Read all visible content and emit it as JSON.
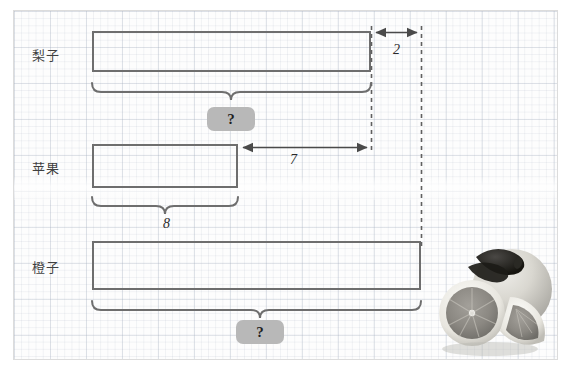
{
  "diagram": {
    "rows": [
      {
        "id": "pear",
        "label": "梨子",
        "label_x": 32,
        "label_y": 45,
        "bar": {
          "x": 92,
          "y": 31,
          "w": 279,
          "h": 41
        }
      },
      {
        "id": "apple",
        "label": "苹果",
        "label_x": 32,
        "label_y": 158,
        "bar": {
          "x": 92,
          "y": 144,
          "w": 146,
          "h": 44
        }
      },
      {
        "id": "orange",
        "label": "橙子",
        "label_x": 32,
        "label_y": 257,
        "bar": {
          "x": 92,
          "y": 241,
          "w": 329,
          "h": 49
        }
      }
    ],
    "braces": [
      {
        "id": "pear-brace",
        "x1": 92,
        "x2": 371,
        "y": 82,
        "tip_y": 96,
        "value": "?"
      },
      {
        "id": "apple-brace",
        "x1": 92,
        "x2": 238,
        "y": 196,
        "tip_y": 210,
        "value": "8"
      },
      {
        "id": "orange-brace",
        "x1": 92,
        "x2": 421,
        "y": 300,
        "tip_y": 314,
        "value": "?"
      }
    ],
    "badges": [
      {
        "id": "pear-unknown",
        "value": "?",
        "x": 207,
        "y": 107,
        "w": 48,
        "h": 24
      },
      {
        "id": "orange-unknown",
        "value": "?",
        "x": 236,
        "y": 320,
        "w": 48,
        "h": 24
      }
    ],
    "numbers": [
      {
        "id": "gap-pear-to-total",
        "value": "8",
        "x": 163,
        "y": 216
      },
      {
        "id": "gap-apple-to-pear",
        "value": "7",
        "x": 290,
        "y": 152
      },
      {
        "id": "gap-pear-top",
        "value": "2",
        "x": 393,
        "y": 42
      }
    ],
    "arrows": [
      {
        "id": "arrow-2",
        "x1": 372,
        "x2": 421,
        "y": 32,
        "double": true
      },
      {
        "id": "arrow-7",
        "x1": 239,
        "x2": 371,
        "y": 147,
        "double": true
      }
    ],
    "guides": [
      {
        "id": "guide-pear-right",
        "x": 371,
        "y1": 26,
        "y2": 151
      },
      {
        "id": "guide-total-right",
        "x": 421,
        "y1": 26,
        "y2": 248
      }
    ],
    "colors": {
      "bar_stroke": "#6e6e6e",
      "badge_fill": "#b8b8b8",
      "guide": "#555555",
      "panel_border": "#dcdcdc",
      "grid": "#aab4c3",
      "text": "#3f3f3f"
    },
    "photo": {
      "id": "citrus-photo",
      "alt": "cut grapefruit halves and whole orange"
    }
  }
}
